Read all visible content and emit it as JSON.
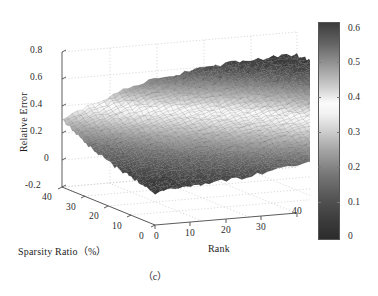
{
  "figure": {
    "caption": "（c）",
    "background": "#ffffff"
  },
  "axes": {
    "z_axis": {
      "title": "Relative Error",
      "ticks": [
        "0.8",
        "0.6",
        "0.4",
        "0.2",
        "0",
        "-0.2"
      ],
      "tick_values": [
        0.8,
        0.6,
        0.4,
        0.2,
        0.0,
        -0.2
      ],
      "range": [
        -0.2,
        0.8
      ]
    },
    "x_axis": {
      "title": "Sparsity Ratio（%）",
      "ticks": [
        "40",
        "30",
        "20",
        "10",
        "0"
      ],
      "tick_values": [
        40,
        30,
        20,
        10,
        0
      ],
      "range": [
        0,
        40
      ]
    },
    "y_axis": {
      "title": "Rank",
      "ticks": [
        "0",
        "10",
        "20",
        "30",
        "40"
      ],
      "tick_values": [
        0,
        10,
        20,
        30,
        40
      ],
      "range": [
        0,
        40
      ]
    }
  },
  "colorbar": {
    "name": "colorbar",
    "ticks": [
      "0.6",
      "0.5",
      "0.4",
      "0.3",
      "0.2",
      "0.1",
      "0"
    ],
    "tick_values": [
      0.6,
      0.5,
      0.4,
      0.3,
      0.2,
      0.1,
      0.0
    ],
    "range": [
      0,
      0.63
    ],
    "colormap": "grayscale-jet",
    "stops": [
      {
        "pos": 0.0,
        "color": "#2c2c2c"
      },
      {
        "pos": 0.08,
        "color": "#3a3a3a"
      },
      {
        "pos": 0.18,
        "color": "#525252"
      },
      {
        "pos": 0.3,
        "color": "#777777"
      },
      {
        "pos": 0.42,
        "color": "#a8a8a8"
      },
      {
        "pos": 0.52,
        "color": "#d8d8d8"
      },
      {
        "pos": 0.58,
        "color": "#f2f2f2"
      },
      {
        "pos": 0.63,
        "color": "#fbfbfb"
      },
      {
        "pos": 0.7,
        "color": "#d0d0d0"
      },
      {
        "pos": 0.8,
        "color": "#9a9a9a"
      },
      {
        "pos": 0.9,
        "color": "#666666"
      },
      {
        "pos": 1.0,
        "color": "#3c3c3c"
      }
    ]
  },
  "chart_data": {
    "type": "surface",
    "title": "",
    "xlabel": "Sparsity Ratio（%）",
    "ylabel": "Rank",
    "zlabel": "Relative Error",
    "xlim": [
      0,
      40
    ],
    "ylim": [
      0,
      40
    ],
    "zlim": [
      -0.2,
      0.8
    ],
    "clim": [
      0,
      0.63
    ],
    "grid": true,
    "legend": "none",
    "colorbar_ticks": [
      0,
      0.1,
      0.2,
      0.3,
      0.4,
      0.5,
      0.6
    ],
    "x": [
      0,
      5,
      10,
      15,
      20,
      25,
      30,
      35,
      40
    ],
    "y": [
      0,
      5,
      10,
      15,
      20,
      25,
      30,
      35,
      40
    ],
    "z_grid": [
      [
        0.05,
        0.06,
        0.08,
        0.1,
        0.13,
        0.16,
        0.2,
        0.25,
        0.3
      ],
      [
        0.06,
        0.08,
        0.11,
        0.14,
        0.18,
        0.22,
        0.27,
        0.33,
        0.39
      ],
      [
        0.08,
        0.11,
        0.15,
        0.19,
        0.24,
        0.29,
        0.34,
        0.41,
        0.47
      ],
      [
        0.1,
        0.14,
        0.19,
        0.24,
        0.29,
        0.34,
        0.4,
        0.47,
        0.53
      ],
      [
        0.13,
        0.18,
        0.24,
        0.29,
        0.34,
        0.39,
        0.45,
        0.52,
        0.57
      ],
      [
        0.16,
        0.22,
        0.29,
        0.34,
        0.39,
        0.44,
        0.5,
        0.56,
        0.6
      ],
      [
        0.2,
        0.27,
        0.34,
        0.4,
        0.45,
        0.5,
        0.55,
        0.6,
        0.62
      ],
      [
        0.25,
        0.33,
        0.41,
        0.47,
        0.52,
        0.56,
        0.6,
        0.62,
        0.63
      ],
      [
        0.3,
        0.39,
        0.47,
        0.53,
        0.57,
        0.6,
        0.62,
        0.63,
        0.63
      ]
    ]
  }
}
